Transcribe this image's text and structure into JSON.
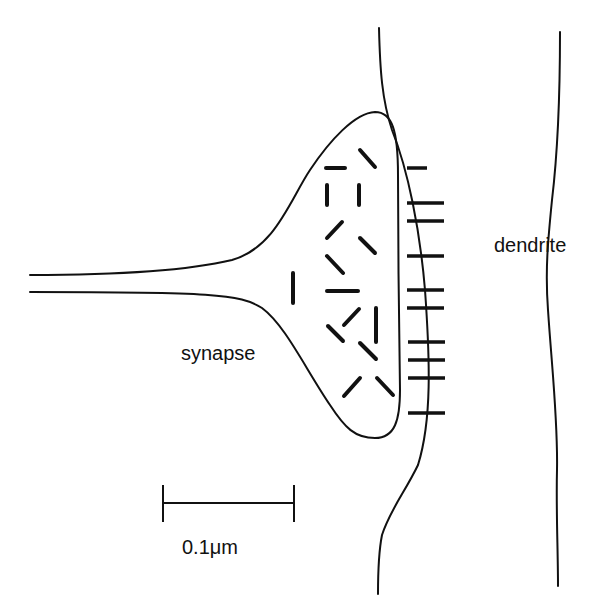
{
  "diagram": {
    "type": "neuron-synapse-schematic",
    "labels": {
      "synapse": "synapse",
      "dendrite": "dendrite",
      "scale_bar": "0.1μm"
    },
    "elements": {
      "axon": "presynaptic axon terminal",
      "bouton": "synaptic bouton with vesicles",
      "vesicle_count": 19,
      "postsynaptic_membrane": "membrane with receptor ticks",
      "receptor_count": 11,
      "dendrite_membrane": "dendrite outer boundary"
    },
    "colors": {
      "stroke": "#111111",
      "background": "#ffffff"
    }
  }
}
